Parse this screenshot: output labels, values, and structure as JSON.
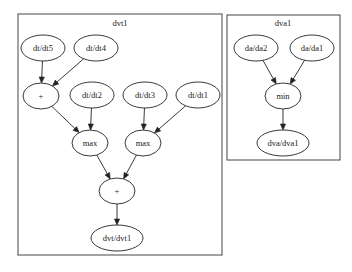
{
  "clusters": [
    {
      "id": "dvt1",
      "label": "dvt1",
      "box": {
        "x": 18,
        "y": 14,
        "w": 204,
        "h": 241
      },
      "label_pos": {
        "x": 120,
        "y": 26
      }
    },
    {
      "id": "dva1",
      "label": "dva1",
      "box": {
        "x": 227,
        "y": 15,
        "w": 113,
        "h": 145
      },
      "label_pos": {
        "x": 283,
        "y": 26
      }
    }
  ],
  "nodes": [
    {
      "id": "dt5",
      "label": "dt/dt5",
      "cluster": "dvt1",
      "cx": 43,
      "cy": 48,
      "rx": 22,
      "ry": 13
    },
    {
      "id": "dt4",
      "label": "dt/dt4",
      "cluster": "dvt1",
      "cx": 96,
      "cy": 48,
      "rx": 22,
      "ry": 13
    },
    {
      "id": "plus1",
      "label": "+",
      "cluster": "dvt1",
      "cx": 41,
      "cy": 96,
      "rx": 18,
      "ry": 13
    },
    {
      "id": "dt2",
      "label": "dt/dt2",
      "cluster": "dvt1",
      "cx": 92,
      "cy": 95,
      "rx": 22,
      "ry": 13
    },
    {
      "id": "dt3",
      "label": "dt/dt3",
      "cluster": "dvt1",
      "cx": 145,
      "cy": 95,
      "rx": 22,
      "ry": 13
    },
    {
      "id": "dt1",
      "label": "dt/dt1",
      "cluster": "dvt1",
      "cx": 198,
      "cy": 95,
      "rx": 22,
      "ry": 13
    },
    {
      "id": "max1",
      "label": "max",
      "cluster": "dvt1",
      "cx": 90,
      "cy": 143,
      "rx": 18,
      "ry": 13
    },
    {
      "id": "max2",
      "label": "max",
      "cluster": "dvt1",
      "cx": 143,
      "cy": 143,
      "rx": 18,
      "ry": 13
    },
    {
      "id": "plus2",
      "label": "+",
      "cluster": "dvt1",
      "cx": 117,
      "cy": 191,
      "rx": 18,
      "ry": 13
    },
    {
      "id": "dvt_out",
      "label": "dvt/dvt1",
      "cluster": "dvt1",
      "cx": 117,
      "cy": 238,
      "rx": 26,
      "ry": 13
    },
    {
      "id": "da2",
      "label": "da/da2",
      "cluster": "dva1",
      "cx": 256,
      "cy": 48,
      "rx": 22,
      "ry": 13
    },
    {
      "id": "da1",
      "label": "da/da1",
      "cluster": "dva1",
      "cx": 312,
      "cy": 48,
      "rx": 22,
      "ry": 13
    },
    {
      "id": "min",
      "label": "min",
      "cluster": "dva1",
      "cx": 283,
      "cy": 96,
      "rx": 18,
      "ry": 13
    },
    {
      "id": "dva_out",
      "label": "dva/dva1",
      "cluster": "dva1",
      "cx": 283,
      "cy": 143,
      "rx": 26,
      "ry": 13
    }
  ],
  "edges": [
    {
      "from": "dt5",
      "to": "plus1"
    },
    {
      "from": "dt4",
      "to": "plus1"
    },
    {
      "from": "plus1",
      "to": "max1"
    },
    {
      "from": "dt2",
      "to": "max1"
    },
    {
      "from": "dt3",
      "to": "max2"
    },
    {
      "from": "dt1",
      "to": "max2"
    },
    {
      "from": "max1",
      "to": "plus2"
    },
    {
      "from": "max2",
      "to": "plus2"
    },
    {
      "from": "plus2",
      "to": "dvt_out"
    },
    {
      "from": "da2",
      "to": "min"
    },
    {
      "from": "da1",
      "to": "min"
    },
    {
      "from": "min",
      "to": "dva_out"
    }
  ]
}
